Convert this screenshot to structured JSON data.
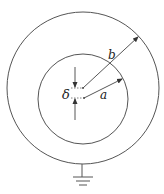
{
  "diagram": {
    "title": "",
    "labels": {
      "delta": "δ",
      "a": "a",
      "b": "b"
    },
    "elements": {
      "outer_circle": {
        "cx": 83,
        "cy": 88,
        "r": 76,
        "role": "outer conductor"
      },
      "inner_circle": {
        "cx": 83,
        "cy": 99,
        "r": 45,
        "role": "inner conductor"
      },
      "outer_center": {
        "x": 83,
        "y": 88
      },
      "inner_center": {
        "x": 84,
        "y": 98
      },
      "radius_b_arrow": {
        "from": [
          83,
          88
        ],
        "to": [
          138,
          37
        ],
        "label": "b"
      },
      "radius_a_arrow": {
        "from": [
          84,
          98
        ],
        "to": [
          122,
          79
        ],
        "label": "a"
      },
      "offset_delta": {
        "label": "δ",
        "arrows": [
          "down to outer center",
          "up to inner center"
        ]
      },
      "ground_symbol": {
        "x": 82,
        "y_top": 164
      }
    },
    "colors": {
      "stroke": "#555555",
      "text": "#222222",
      "background": "#ffffff"
    }
  }
}
